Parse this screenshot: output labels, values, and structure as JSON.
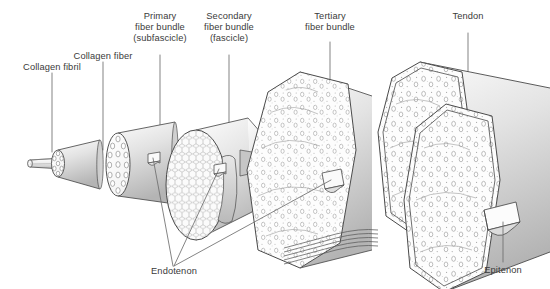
{
  "figure": {
    "type": "anatomical-diagram",
    "background_color": "#ffffff",
    "line_color": "#4a4a4a",
    "text_color": "#3a3a3a",
    "fill_light": "#fcfcfc",
    "fill_shade": "#c9c9c9",
    "fill_mid": "#e2e2e2"
  },
  "labels": {
    "collagen_fibril": "Collagen fibril",
    "collagen_fiber": "Collagen fiber",
    "primary_line1": "Primary",
    "primary_line2": "fiber bundle",
    "primary_line3": "(subfascicle)",
    "secondary_line1": "Secondary",
    "secondary_line2": "fiber bundle",
    "secondary_line3": "(fascicle)",
    "tertiary_line1": "Tertiary",
    "tertiary_line2": "fiber bundle",
    "tendon": "Tendon",
    "endotenon": "Endotenon",
    "epitenon": "Epitenon"
  },
  "structures": [
    {
      "name": "collagen-fibril",
      "order": 1,
      "cross_section": "few-circles",
      "label": "Collagen fibril"
    },
    {
      "name": "collagen-fiber",
      "order": 2,
      "cross_section": "seven-circles",
      "label": "Collagen fiber"
    },
    {
      "name": "primary-fiber-bundle",
      "order": 3,
      "cross_section": "many-circles",
      "label": "Primary fiber bundle (subfascicle)"
    },
    {
      "name": "secondary-fiber-bundle",
      "order": 4,
      "cross_section": "honeycomb",
      "label": "Secondary fiber bundle (fascicle)"
    },
    {
      "name": "tertiary-fiber-bundle",
      "order": 5,
      "cross_section": "stippled-oval",
      "label": "Tertiary fiber bundle"
    },
    {
      "name": "tendon",
      "order": 6,
      "cross_section": "large-oval",
      "label": "Tendon"
    }
  ],
  "sheaths": [
    {
      "name": "endotenon",
      "label": "Endotenon",
      "leader_count": 3
    },
    {
      "name": "epitenon",
      "label": "Epitenon",
      "leader_count": 1
    }
  ]
}
